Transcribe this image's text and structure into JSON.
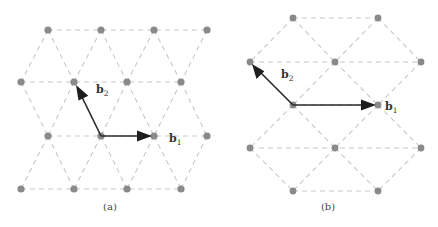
{
  "figure": {
    "panels": [
      {
        "id": "a",
        "caption": "(a)",
        "vector_labels": {
          "b1": {
            "base": "b",
            "sub": "1"
          },
          "b2": {
            "base": "b",
            "sub": "2"
          }
        },
        "description": "Triangular lattice with basis vectors b1 (horizontal) and b2 (up-left)"
      },
      {
        "id": "b",
        "caption": "(b)",
        "vector_labels": {
          "b1": {
            "base": "b",
            "sub": "1"
          },
          "b2": {
            "base": "b",
            "sub": "2"
          }
        },
        "description": "Hexagonal/triangular lattice with basis vectors b1 (horizontal) and b2 (up-left)"
      }
    ],
    "colors": {
      "dot": "#8a8a8a",
      "dashed_line": "#c8c8c8",
      "arrow": "#2a2a2a"
    }
  }
}
